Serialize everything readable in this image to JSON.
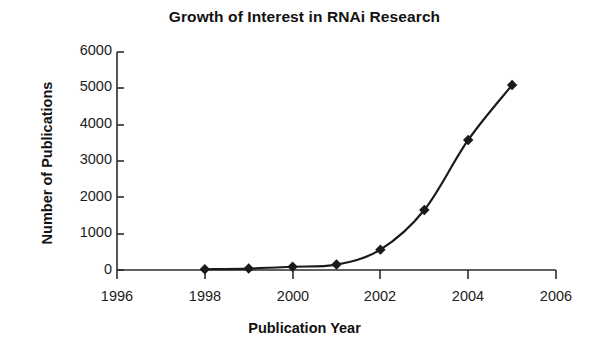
{
  "chart_data": {
    "type": "line",
    "title": "Growth of Interest in RNAi Research",
    "xlabel": "Publication Year",
    "ylabel": "Number of Publications",
    "x": [
      1998,
      1999,
      2000,
      2001,
      2002,
      2003,
      2004,
      2005
    ],
    "values": [
      20,
      40,
      90,
      150,
      560,
      1650,
      3580,
      5090
    ],
    "series": [
      {
        "name": "Number of Publications",
        "values": [
          20,
          40,
          90,
          150,
          560,
          1650,
          3580,
          5090
        ]
      }
    ],
    "xlim": [
      1996,
      2006
    ],
    "ylim": [
      0,
      6000
    ],
    "xticks": [
      1996,
      1998,
      2000,
      2002,
      2004,
      2006
    ],
    "xtick_labels": [
      "1996",
      "1998",
      "2000",
      "2002",
      "2004",
      "2006"
    ],
    "yticks": [
      0,
      1000,
      2000,
      3000,
      4000,
      5000,
      6000
    ],
    "ytick_labels": [
      "0",
      "1000",
      "2000",
      "3000",
      "4000",
      "5000",
      "6000"
    ],
    "grid": false,
    "legend": false,
    "marker": "diamond",
    "line_color": "#1a1a1a",
    "marker_color": "#1a1a1a",
    "background_color": "#ffffff"
  }
}
